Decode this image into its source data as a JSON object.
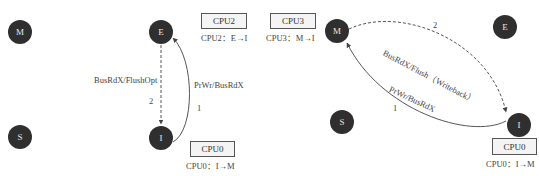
{
  "left_panel": {
    "states": [
      {
        "id": "M",
        "label": "M"
      },
      {
        "id": "E",
        "label": "E"
      },
      {
        "id": "S",
        "label": "S"
      },
      {
        "id": "I",
        "label": "I"
      }
    ],
    "transitions": [
      {
        "from": "E",
        "to": "I",
        "style": "dashed",
        "label": "BusRdX/FlushOpt",
        "order": "2"
      },
      {
        "from": "I",
        "to": "E",
        "style": "solid",
        "label": "PrWr/BusRdX",
        "order": "1"
      }
    ],
    "cpus": [
      {
        "box": "CPU2",
        "caption": "CPU2：E→I"
      },
      {
        "box": "CPU0",
        "caption": "CPU0：I→M"
      }
    ]
  },
  "right_panel": {
    "states": [
      {
        "id": "M",
        "label": "M"
      },
      {
        "id": "E",
        "label": "E"
      },
      {
        "id": "S",
        "label": "S"
      },
      {
        "id": "I",
        "label": "I"
      }
    ],
    "transitions": [
      {
        "from": "M",
        "to": "I",
        "style": "dashed",
        "label": "BusRdX/Flush（Writeback）",
        "order": "2"
      },
      {
        "from": "I",
        "to": "M",
        "style": "solid",
        "label": "PrWr/BusRdX",
        "order": "1"
      }
    ],
    "cpus": [
      {
        "box": "CPU3",
        "caption": "CPU3：M→I"
      },
      {
        "box": "CPU0",
        "caption": "CPU0：I→M"
      }
    ]
  },
  "colors": {
    "node_fill": "#2f2f2f",
    "node_text": "#e6e6e6",
    "edge": "#444444",
    "box_fill": "#f4f4f4"
  }
}
